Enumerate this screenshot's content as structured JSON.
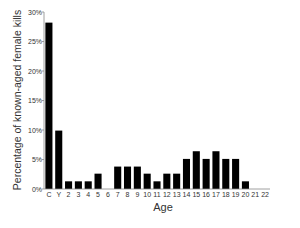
{
  "chart_data": {
    "type": "bar",
    "title": "",
    "xlabel": "Age",
    "ylabel": "Percentage of known-aged female kills",
    "categories": [
      "C",
      "Y",
      "2",
      "3",
      "4",
      "5",
      "6",
      "7",
      "8",
      "9",
      "10",
      "11",
      "12",
      "13",
      "14",
      "15",
      "16",
      "17",
      "18",
      "19",
      "20",
      "21",
      "22"
    ],
    "values": [
      28.2,
      9.9,
      1.3,
      1.3,
      1.3,
      2.6,
      0,
      3.8,
      3.8,
      3.8,
      2.6,
      1.3,
      2.6,
      2.6,
      5.1,
      6.4,
      5.1,
      6.4,
      5.1,
      5.1,
      1.3,
      0,
      0
    ],
    "ylim": [
      0,
      30
    ],
    "yticks": [
      0,
      5,
      10,
      15,
      20,
      25,
      30
    ],
    "ytick_labels": [
      "0%",
      "5%",
      "10%",
      "15%",
      "20%",
      "25%",
      "30%"
    ],
    "grid": false,
    "legend": null,
    "bar_color": "#000000"
  }
}
